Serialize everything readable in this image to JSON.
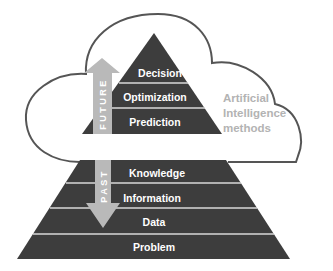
{
  "diagram": {
    "colors": {
      "pyramid_fill": "#3d3d3d",
      "band_separator": "#d9d9d9",
      "arrow_fill": "#b9b9b9",
      "cloud_stroke": "#555555",
      "ai_text": "#b3b3b3"
    },
    "cloud": {
      "label_lines": [
        "Artificial",
        "Intelligence",
        "methods"
      ]
    },
    "upper_pyramid": {
      "levels": [
        {
          "label": "Decision"
        },
        {
          "label": "Optimization"
        },
        {
          "label": "Prediction"
        }
      ]
    },
    "lower_pyramid": {
      "levels": [
        {
          "label": "Knowledge"
        },
        {
          "label": "Information"
        },
        {
          "label": "Data"
        },
        {
          "label": "Problem"
        }
      ]
    },
    "arrows": {
      "future": {
        "label": "FUTURE",
        "direction": "up"
      },
      "past": {
        "label": "PAST",
        "direction": "down"
      }
    }
  }
}
